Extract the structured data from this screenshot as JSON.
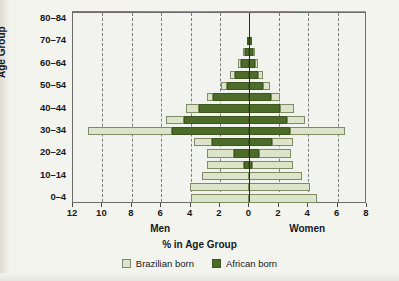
{
  "chart_data": {
    "type": "bar",
    "subtype": "population-pyramid",
    "title": "",
    "xlabel": "% in Age Group",
    "ylabel": "Age Group",
    "left_side_label": "Men",
    "right_side_label": "Women",
    "categories": [
      "0–4",
      "5–9",
      "10–14",
      "15–19",
      "20–24",
      "25–29",
      "30–34",
      "35–39",
      "40–44",
      "45–49",
      "50–54",
      "55–59",
      "60–64",
      "65–69",
      "70–74",
      "75–79",
      "80–84"
    ],
    "y_tick_labels": [
      "0–4",
      "10–14",
      "20–24",
      "30–34",
      "40–44",
      "50–54",
      "60–64",
      "70–74",
      "80–84"
    ],
    "x_tick_labels": [
      "12",
      "10",
      "8",
      "6",
      "4",
      "2",
      "0",
      "2",
      "4",
      "6",
      "8"
    ],
    "x_tick_values": [
      -12,
      -10,
      -8,
      -6,
      -4,
      -2,
      0,
      2,
      4,
      6,
      8
    ],
    "xlim": [
      -12,
      8
    ],
    "gridlines_left": [
      -10,
      -8,
      -6,
      -4,
      -2
    ],
    "gridlines_right": [
      2,
      4,
      6
    ],
    "grid": true,
    "legend_position": "bottom-center",
    "series": [
      {
        "name": "African born",
        "color": "#4d6b29",
        "men": [
          0.0,
          0.0,
          0.0,
          0.35,
          1.05,
          2.55,
          5.25,
          4.45,
          3.45,
          2.45,
          1.55,
          0.95,
          0.55,
          0.3,
          0.15,
          0.0,
          0.0
        ],
        "women": [
          0.0,
          0.0,
          0.0,
          0.2,
          0.65,
          1.55,
          2.75,
          2.55,
          2.1,
          1.45,
          0.95,
          0.6,
          0.4,
          0.25,
          0.15,
          0.0,
          0.0
        ]
      },
      {
        "name": "Brazilian born",
        "color": "#dee4c9",
        "men": [
          4.0,
          4.05,
          3.25,
          2.55,
          1.85,
          1.2,
          5.75,
          1.25,
          0.85,
          0.45,
          0.4,
          0.35,
          0.2,
          0.15,
          0.0,
          0.0,
          0.0
        ],
        "women": [
          4.6,
          4.1,
          3.55,
          2.8,
          2.15,
          1.45,
          3.75,
          1.25,
          0.95,
          0.6,
          0.45,
          0.35,
          0.2,
          0.15,
          0.0,
          0.0,
          0.0
        ]
      }
    ]
  },
  "legend": {
    "items": [
      {
        "label": "Brazilian born",
        "key": "brazilian"
      },
      {
        "label": "African born",
        "key": "african"
      }
    ]
  },
  "colors": {
    "african_born": "#4d6b29",
    "brazilian_born": "#dee4c9",
    "axis": "#2a2a2a",
    "grid": "#7d7d7d",
    "background": "#f4f4ef"
  }
}
